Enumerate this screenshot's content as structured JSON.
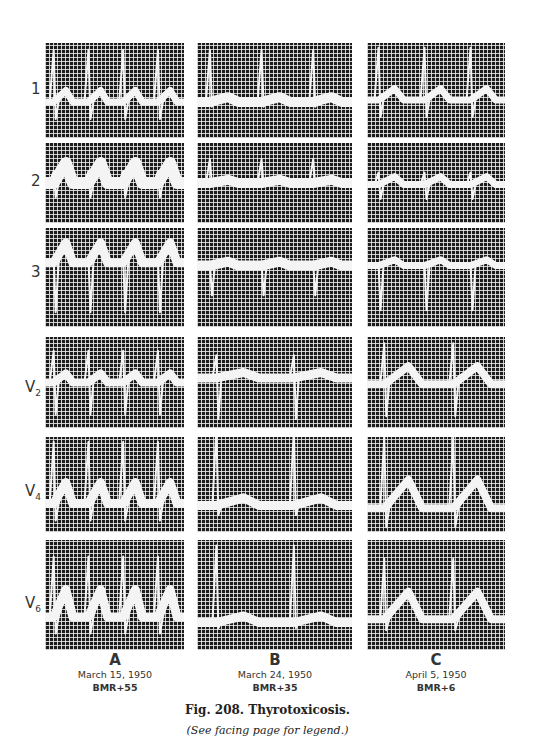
{
  "figure": {
    "number_title": "Fig. 208. Thyrotoxicosis.",
    "note": "(See facing page for legend.)"
  },
  "leads": [
    {
      "id": "1",
      "label": "1",
      "sub": ""
    },
    {
      "id": "2",
      "label": "2",
      "sub": ""
    },
    {
      "id": "3",
      "label": "3",
      "sub": ""
    },
    {
      "id": "V2",
      "label": "V",
      "sub": "2"
    },
    {
      "id": "V4",
      "label": "V",
      "sub": "4"
    },
    {
      "id": "V6",
      "label": "V",
      "sub": "6"
    }
  ],
  "columns": [
    {
      "letter": "A",
      "date": "March 15, 1950",
      "bmr": "BMR+55"
    },
    {
      "letter": "B",
      "date": "March 24, 1950",
      "bmr": "BMR+35"
    },
    {
      "letter": "C",
      "date": "April 5, 1950",
      "bmr": "BMR+6"
    }
  ],
  "colors": {
    "grid_background": "#1c1c1c",
    "grid_lines": "#ebebeb",
    "trace": "#f4f4f4"
  }
}
